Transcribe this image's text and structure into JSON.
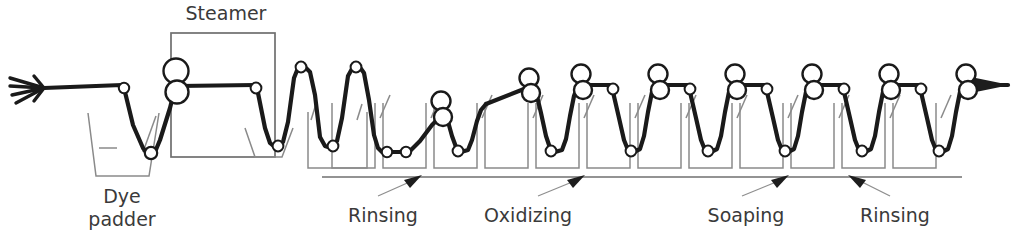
{
  "diagram": {
    "canvas": {
      "width": 1019,
      "height": 245
    },
    "colors": {
      "fabric_web": "#1a1a1a",
      "vessel_outline": "#8a8a8a",
      "baseline": "#6f6f6f",
      "label_text": "#3a3a3a",
      "leader_line": "#8e8e8e",
      "background": "#ffffff"
    }
  },
  "labels": {
    "steamer": "Steamer",
    "dye_padder_line1": "Dye",
    "dye_padder_line2": "padder",
    "rinsing_1": "Rinsing",
    "oxidizing": "Oxidizing",
    "soaping": "Soaping",
    "rinsing_2": "Rinsing"
  },
  "stages": [
    {
      "name": "entry",
      "label": "",
      "baths": 0
    },
    {
      "name": "dye-padder",
      "label": "Dye padder",
      "baths": 1
    },
    {
      "name": "steamer",
      "label": "Steamer",
      "baths": 0
    },
    {
      "name": "rinsing-1",
      "label": "Rinsing",
      "baths": 3
    },
    {
      "name": "oxidizing",
      "label": "Oxidizing",
      "baths": 3
    },
    {
      "name": "soaping",
      "label": "Soaping",
      "baths": 3
    },
    {
      "name": "rinsing-2",
      "label": "Rinsing",
      "baths": 2
    },
    {
      "name": "exit",
      "label": "",
      "baths": 0
    }
  ],
  "geometry": {
    "web_top_y": 84,
    "bath_bottom_y": 152,
    "tank_pitch": 51,
    "first_tank_x": 332,
    "baseline_y": 177,
    "baseline_x1": 322,
    "baseline_x2": 962
  },
  "label_positions": {
    "steamer": {
      "x": 226,
      "y": 18
    },
    "dye_padder_line1": {
      "x": 122,
      "y": 203
    },
    "dye_padder_line2": {
      "x": 122,
      "y": 225
    },
    "rinsing_1": {
      "x": 382,
      "y": 220
    },
    "oxidizing": {
      "x": 525,
      "y": 220
    },
    "soaping": {
      "x": 745,
      "y": 220
    },
    "rinsing_2": {
      "x": 890,
      "y": 220
    }
  }
}
